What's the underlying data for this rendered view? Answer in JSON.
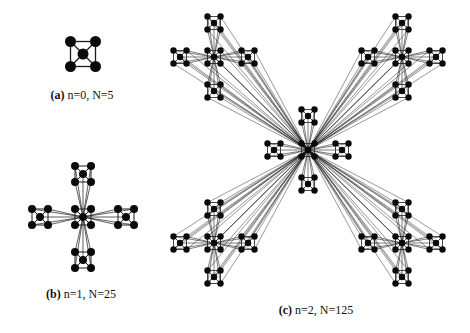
{
  "figure": {
    "colors": {
      "node": "#0a0a0a",
      "edge": "#1a1a1a",
      "background": "#ffffff"
    },
    "panels": [
      {
        "id": "a",
        "label": "(a)",
        "caption": "n=0, N=5",
        "generation": 0,
        "node_count": 5,
        "center": [
          83,
          54
        ],
        "unit_offset": 12.5,
        "node_radius": 5.5,
        "caption_pos": [
          82,
          88
        ]
      },
      {
        "id": "b",
        "label": "(b)",
        "caption": "n=1, N=25",
        "generation": 1,
        "node_count": 25,
        "center": [
          83,
          217
        ],
        "arm_offset": 43,
        "unit_offset": 8,
        "node_radius": 4,
        "caption_pos": [
          81,
          287
        ]
      },
      {
        "id": "c",
        "label": "(c)",
        "caption": "n=2, N=125",
        "generation": 2,
        "node_count": 125,
        "center": [
          308,
          150
        ],
        "super_arm_offset": [
          94,
          93
        ],
        "arm_offset": 34,
        "unit_offset": 6.5,
        "node_radius": 3.2,
        "caption_pos": [
          316,
          303
        ]
      }
    ]
  }
}
